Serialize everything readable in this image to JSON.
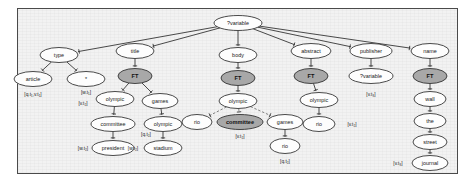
{
  "figure": {
    "name": "query-tree-diagram",
    "frame": {
      "background": "#f2f2f2",
      "border_color": "#4a4a4a"
    },
    "node_fill_plain": "#fdfdfd",
    "node_fill_highlight": "#a8a8a8",
    "edge_color": "#2b2b2b",
    "edge_dashed_color": "#6d6d6d"
  },
  "nodes": [
    {
      "id": "root",
      "label": "?variable",
      "x": 238,
      "y": 23,
      "rx": 24,
      "ry": 7.5,
      "style": "plain"
    },
    {
      "id": "type",
      "label": "type",
      "x": 59,
      "y": 55,
      "rx": 19,
      "ry": 7.5,
      "style": "plain"
    },
    {
      "id": "article",
      "label": "article",
      "x": 33,
      "y": 79,
      "rx": 19,
      "ry": 7.5,
      "style": "plain"
    },
    {
      "id": "star",
      "label": "*",
      "x": 86,
      "y": 79,
      "rx": 19,
      "ry": 7.5,
      "style": "plain"
    },
    {
      "id": "title",
      "label": "title",
      "x": 135,
      "y": 51,
      "rx": 19,
      "ry": 7.5,
      "style": "plain"
    },
    {
      "id": "ft-title",
      "label": "FT",
      "x": 135,
      "y": 76,
      "rx": 17,
      "ry": 7.5,
      "style": "highlight"
    },
    {
      "id": "olympic-title",
      "label": "olympic",
      "x": 115,
      "y": 99,
      "rx": 19,
      "ry": 7.5,
      "style": "plain"
    },
    {
      "id": "games-title",
      "label": "games",
      "x": 160,
      "y": 101,
      "rx": 18,
      "ry": 7.5,
      "style": "plain"
    },
    {
      "id": "committee-title",
      "label": "committee",
      "x": 113,
      "y": 124,
      "rx": 22,
      "ry": 7.5,
      "style": "plain"
    },
    {
      "id": "president",
      "label": "president",
      "x": 113,
      "y": 148,
      "rx": 21,
      "ry": 7.5,
      "style": "plain"
    },
    {
      "id": "olympic-games",
      "label": "olympic",
      "x": 163,
      "y": 124,
      "rx": 19,
      "ry": 7.5,
      "style": "plain"
    },
    {
      "id": "stadium",
      "label": "stadium",
      "x": 163,
      "y": 148,
      "rx": 19,
      "ry": 7.5,
      "style": "plain"
    },
    {
      "id": "body",
      "label": "body",
      "x": 238,
      "y": 55,
      "rx": 19,
      "ry": 7.5,
      "style": "plain"
    },
    {
      "id": "ft-body",
      "label": "FT",
      "x": 238,
      "y": 78,
      "rx": 17,
      "ry": 7.5,
      "style": "highlight"
    },
    {
      "id": "olympic-body",
      "label": "olympic",
      "x": 238,
      "y": 101,
      "rx": 19,
      "ry": 7.5,
      "style": "plain"
    },
    {
      "id": "rio-body",
      "label": "rio",
      "x": 197,
      "y": 122,
      "rx": 15,
      "ry": 7.5,
      "style": "plain"
    },
    {
      "id": "committee-body",
      "label": "committee",
      "x": 240,
      "y": 122,
      "rx": 23,
      "ry": 7.5,
      "style": "highlight"
    },
    {
      "id": "games-body",
      "label": "games",
      "x": 285,
      "y": 122,
      "rx": 18,
      "ry": 7.5,
      "style": "plain"
    },
    {
      "id": "rio-games",
      "label": "rio",
      "x": 285,
      "y": 146,
      "rx": 15,
      "ry": 7.5,
      "style": "plain"
    },
    {
      "id": "abstract",
      "label": "abstract",
      "x": 311,
      "y": 51,
      "rx": 20,
      "ry": 7.5,
      "style": "plain"
    },
    {
      "id": "ft-abstract",
      "label": "FT",
      "x": 311,
      "y": 76,
      "rx": 17,
      "ry": 7.5,
      "style": "highlight"
    },
    {
      "id": "olympic-abs",
      "label": "olympic",
      "x": 319,
      "y": 100,
      "rx": 19,
      "ry": 7.5,
      "style": "plain"
    },
    {
      "id": "rio-abs",
      "label": "rio",
      "x": 319,
      "y": 124,
      "rx": 16,
      "ry": 7.5,
      "style": "plain"
    },
    {
      "id": "publisher",
      "label": "publisher",
      "x": 371,
      "y": 51,
      "rx": 21,
      "ry": 7.5,
      "style": "plain"
    },
    {
      "id": "var-publisher",
      "label": "?variable",
      "x": 371,
      "y": 76,
      "rx": 22,
      "ry": 7.5,
      "style": "plain"
    },
    {
      "id": "name",
      "label": "name",
      "x": 430,
      "y": 51,
      "rx": 19,
      "ry": 7.5,
      "style": "plain"
    },
    {
      "id": "ft-name",
      "label": "FT",
      "x": 430,
      "y": 76,
      "rx": 17,
      "ry": 7.5,
      "style": "highlight"
    },
    {
      "id": "wall",
      "label": "wall",
      "x": 430,
      "y": 99,
      "rx": 16,
      "ry": 7.5,
      "style": "plain"
    },
    {
      "id": "the",
      "label": "the",
      "x": 430,
      "y": 121,
      "rx": 16,
      "ry": 7.5,
      "style": "plain"
    },
    {
      "id": "street",
      "label": "street",
      "x": 430,
      "y": 142,
      "rx": 17,
      "ry": 7.5,
      "style": "plain"
    },
    {
      "id": "journal",
      "label": "journal",
      "x": 430,
      "y": 163,
      "rx": 18,
      "ry": 7.5,
      "style": "plain"
    }
  ],
  "edges": [
    {
      "from": "root",
      "to": "type",
      "kind": "solid"
    },
    {
      "from": "root",
      "to": "title",
      "kind": "solid"
    },
    {
      "from": "root",
      "to": "body",
      "kind": "solid"
    },
    {
      "from": "root",
      "to": "abstract",
      "kind": "solid"
    },
    {
      "from": "root",
      "to": "publisher",
      "kind": "solid"
    },
    {
      "from": "root",
      "to": "name",
      "kind": "solid"
    },
    {
      "from": "type",
      "to": "article",
      "kind": "solid"
    },
    {
      "from": "type",
      "to": "star",
      "kind": "solid"
    },
    {
      "from": "title",
      "to": "ft-title",
      "kind": "solid"
    },
    {
      "from": "ft-title",
      "to": "olympic-title",
      "kind": "solid"
    },
    {
      "from": "ft-title",
      "to": "games-title",
      "kind": "solid"
    },
    {
      "from": "olympic-title",
      "to": "committee-title",
      "kind": "solid"
    },
    {
      "from": "committee-title",
      "to": "president",
      "kind": "solid"
    },
    {
      "from": "games-title",
      "to": "olympic-games",
      "kind": "solid"
    },
    {
      "from": "olympic-games",
      "to": "stadium",
      "kind": "solid"
    },
    {
      "from": "body",
      "to": "ft-body",
      "kind": "solid"
    },
    {
      "from": "ft-body",
      "to": "olympic-body",
      "kind": "solid"
    },
    {
      "from": "olympic-body",
      "to": "rio-body",
      "kind": "dashed"
    },
    {
      "from": "olympic-body",
      "to": "committee-body",
      "kind": "dashed"
    },
    {
      "from": "olympic-body",
      "to": "games-body",
      "kind": "dashed"
    },
    {
      "from": "games-body",
      "to": "rio-games",
      "kind": "solid"
    },
    {
      "from": "abstract",
      "to": "ft-abstract",
      "kind": "solid"
    },
    {
      "from": "ft-abstract",
      "to": "olympic-abs",
      "kind": "solid"
    },
    {
      "from": "olympic-abs",
      "to": "rio-abs",
      "kind": "solid"
    },
    {
      "from": "publisher",
      "to": "var-publisher",
      "kind": "solid"
    },
    {
      "from": "name",
      "to": "ft-name",
      "kind": "solid"
    },
    {
      "from": "ft-name",
      "to": "wall",
      "kind": "solid"
    },
    {
      "from": "wall",
      "to": "the",
      "kind": "solid"
    },
    {
      "from": "the",
      "to": "street",
      "kind": "solid"
    },
    {
      "from": "street",
      "to": "journal",
      "kind": "solid"
    }
  ],
  "annotations": [
    {
      "id": "ann-article",
      "text": "[q.t₁,v.t₁]",
      "x": 33,
      "y": 94
    },
    {
      "id": "ann-star",
      "text": "[w.t₁]",
      "x": 86,
      "y": 92
    },
    {
      "id": "ann-star2",
      "text": "[v.t₂]",
      "x": 83,
      "y": 103
    },
    {
      "id": "ann-committee",
      "text": "[q.t₂]",
      "x": 146,
      "y": 134
    },
    {
      "id": "ann-president",
      "text": "[w.t₂]",
      "x": 83,
      "y": 148
    },
    {
      "id": "ann-stadium",
      "text": "[w.t₂]",
      "x": 133,
      "y": 148
    },
    {
      "id": "ann-commbody",
      "text": "[v.t₂]",
      "x": 240,
      "y": 136
    },
    {
      "id": "ann-riogames",
      "text": "[q.t₂]",
      "x": 285,
      "y": 161
    },
    {
      "id": "ann-rioabs",
      "text": "[v.t₂]",
      "x": 352,
      "y": 124
    },
    {
      "id": "ann-varpub",
      "text": "[v.t₃]",
      "x": 371,
      "y": 94
    },
    {
      "id": "ann-journal",
      "text": "[v.t₃]",
      "x": 398,
      "y": 163
    }
  ]
}
